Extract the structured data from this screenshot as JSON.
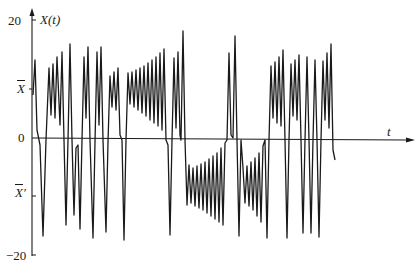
{
  "chart_data": {
    "type": "line",
    "title": "",
    "xlabel": "t",
    "ylabel": "X(t)",
    "ylim": [
      -20,
      20
    ],
    "grid": false,
    "legend": null,
    "y_ticks": [
      {
        "value": 20,
        "label": "20"
      },
      {
        "value": 8.3,
        "label": "X̄"
      },
      {
        "value": 0,
        "label": "0"
      },
      {
        "value": -9.8,
        "label": "X̄′"
      },
      {
        "value": -20,
        "label": "−20"
      }
    ],
    "annotations": [
      "X̄ marks the positive fixed point",
      "X̄′ marks the negative fixed point"
    ],
    "series": [
      {
        "name": "X(t)",
        "color": "#1a1a1a",
        "pixel_path": [
          [
            33,
            95
          ],
          [
            35,
            60
          ],
          [
            37,
            130
          ],
          [
            40,
            145
          ],
          [
            43,
            236
          ],
          [
            46,
            140
          ],
          [
            49,
            68
          ],
          [
            51,
            115
          ],
          [
            53,
            64
          ],
          [
            55,
            118
          ],
          [
            57,
            57
          ],
          [
            60,
            125
          ],
          [
            62,
            52
          ],
          [
            64,
            140
          ],
          [
            66,
            225
          ],
          [
            68,
            140
          ],
          [
            70,
            44
          ],
          [
            72,
            140
          ],
          [
            74,
            215
          ],
          [
            76,
            148
          ],
          [
            78,
            145
          ],
          [
            80,
            229
          ],
          [
            82,
            140
          ],
          [
            84,
            57
          ],
          [
            86,
            118
          ],
          [
            88,
            47
          ],
          [
            90,
            140
          ],
          [
            93,
            238
          ],
          [
            95,
            142
          ],
          [
            97,
            52
          ],
          [
            99,
            125
          ],
          [
            101,
            47
          ],
          [
            103,
            140
          ],
          [
            106,
            232
          ],
          [
            108,
            142
          ],
          [
            110,
            76
          ],
          [
            112,
            107
          ],
          [
            114,
            72
          ],
          [
            116,
            110
          ],
          [
            118,
            68
          ],
          [
            120,
            135
          ],
          [
            122,
            140
          ],
          [
            124,
            240
          ],
          [
            126,
            140
          ],
          [
            128,
            73
          ],
          [
            130,
            104
          ],
          [
            132,
            72
          ],
          [
            134,
            107
          ],
          [
            136,
            70
          ],
          [
            138,
            110
          ],
          [
            140,
            68
          ],
          [
            142,
            113
          ],
          [
            144,
            66
          ],
          [
            146,
            116
          ],
          [
            148,
            63
          ],
          [
            150,
            120
          ],
          [
            152,
            60
          ],
          [
            154,
            123
          ],
          [
            156,
            57
          ],
          [
            158,
            126
          ],
          [
            160,
            53
          ],
          [
            162,
            130
          ],
          [
            164,
            49
          ],
          [
            166,
            140
          ],
          [
            168,
            145
          ],
          [
            170,
            235
          ],
          [
            172,
            140
          ],
          [
            174,
            58
          ],
          [
            176,
            128
          ],
          [
            178,
            52
          ],
          [
            180,
            135
          ],
          [
            181,
            140
          ],
          [
            183,
            31
          ],
          [
            185,
            140
          ],
          [
            187,
            205
          ],
          [
            189,
            165
          ],
          [
            191,
            203
          ],
          [
            193,
            168
          ],
          [
            195,
            206
          ],
          [
            197,
            166
          ],
          [
            199,
            208
          ],
          [
            201,
            164
          ],
          [
            203,
            210
          ],
          [
            205,
            162
          ],
          [
            207,
            213
          ],
          [
            209,
            159
          ],
          [
            211,
            216
          ],
          [
            213,
            156
          ],
          [
            215,
            219
          ],
          [
            217,
            153
          ],
          [
            219,
            222
          ],
          [
            221,
            148
          ],
          [
            223,
            225
          ],
          [
            225,
            143
          ],
          [
            227,
            140
          ],
          [
            229,
            53
          ],
          [
            231,
            135
          ],
          [
            233,
            138
          ],
          [
            235,
            36
          ],
          [
            237,
            140
          ],
          [
            239,
            236
          ],
          [
            241,
            140
          ],
          [
            243,
            168
          ],
          [
            245,
            203
          ],
          [
            247,
            166
          ],
          [
            249,
            206
          ],
          [
            251,
            162
          ],
          [
            253,
            210
          ],
          [
            255,
            158
          ],
          [
            257,
            216
          ],
          [
            259,
            153
          ],
          [
            261,
            222
          ],
          [
            263,
            146
          ],
          [
            265,
            140
          ],
          [
            267,
            238
          ],
          [
            269,
            140
          ],
          [
            271,
            66
          ],
          [
            273,
            118
          ],
          [
            275,
            62
          ],
          [
            277,
            123
          ],
          [
            279,
            57
          ],
          [
            281,
            126
          ],
          [
            283,
            50
          ],
          [
            285,
            140
          ],
          [
            287,
            238
          ],
          [
            289,
            140
          ],
          [
            291,
            64
          ],
          [
            293,
            116
          ],
          [
            295,
            60
          ],
          [
            297,
            120
          ],
          [
            299,
            55
          ],
          [
            301,
            140
          ],
          [
            303,
            233
          ],
          [
            305,
            140
          ],
          [
            307,
            57
          ],
          [
            309,
            140
          ],
          [
            311,
            233
          ],
          [
            313,
            140
          ],
          [
            315,
            60
          ],
          [
            317,
            140
          ],
          [
            319,
            237
          ],
          [
            321,
            140
          ],
          [
            323,
            61
          ],
          [
            325,
            120
          ],
          [
            327,
            53
          ],
          [
            329,
            128
          ],
          [
            331,
            44
          ],
          [
            333,
            150
          ],
          [
            335,
            160
          ]
        ]
      }
    ]
  },
  "axes": {
    "y_label": "X(t)",
    "x_label": "t",
    "tick_20": "20",
    "tick_xbar": "X",
    "tick_0": "0",
    "tick_xbar_prime": "X",
    "tick_xbar_prime_mark": "′",
    "tick_neg20": "−20"
  }
}
